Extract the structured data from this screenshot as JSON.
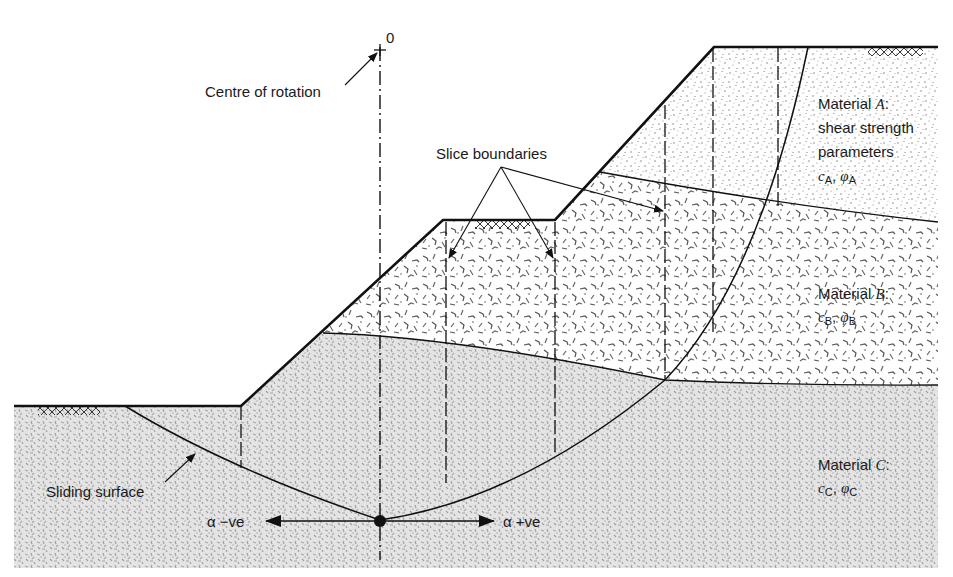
{
  "diagram": {
    "type": "slope-stability-method-of-slices",
    "colors": {
      "line": "#111111",
      "material_a_dots": "#6e6e6e",
      "material_b_flecks": "#5a5a5a",
      "material_c_fill": "#b8b8b8",
      "background": "#ffffff"
    },
    "labels": {
      "origin": "0",
      "centre_of_rotation": "Centre of rotation",
      "slice_boundaries": "Slice boundaries",
      "sliding_surface": "Sliding surface",
      "alpha_negative": "α −ve",
      "alpha_positive": "α +ve"
    },
    "materials": [
      {
        "id": "A",
        "line1_prefix": "Material ",
        "line1_letter": "A",
        "line1_suffix": ":",
        "line2": "shear strength",
        "line3": "parameters",
        "params": "cₐ, φₐ",
        "c_sub": "A",
        "phi_sub": "A",
        "texture": "fine dots"
      },
      {
        "id": "B",
        "line1_prefix": "Material ",
        "line1_letter": "B",
        "line1_suffix": ":",
        "c_sub": "B",
        "phi_sub": "B",
        "texture": "coarse flecks"
      },
      {
        "id": "C",
        "line1_prefix": "Material ",
        "line1_letter": "C",
        "line1_suffix": ":",
        "c_sub": "C",
        "phi_sub": "C",
        "texture": "dense grey speckle"
      }
    ],
    "symbols": {
      "c": "c",
      "phi": "φ",
      "comma": ", "
    }
  }
}
